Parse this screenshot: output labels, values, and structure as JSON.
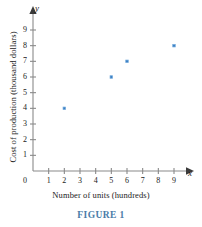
{
  "chart_data": {
    "type": "scatter",
    "title": "",
    "xlabel": "Number of units (hundreds)",
    "ylabel": "Cost of production (thousand dollars)",
    "xlim": [
      0,
      9.6
    ],
    "ylim": [
      0,
      9.6
    ],
    "xticks": [
      0,
      1,
      2,
      3,
      4,
      5,
      6,
      7,
      8,
      9
    ],
    "yticks": [
      1,
      2,
      3,
      4,
      5,
      6,
      7,
      8,
      9
    ],
    "grid": false,
    "legend": null,
    "x_axis_variable": "x",
    "y_axis_variable": "y",
    "points": [
      {
        "x": 2,
        "y": 4
      },
      {
        "x": 5,
        "y": 6
      },
      {
        "x": 6,
        "y": 7
      },
      {
        "x": 9,
        "y": 8
      }
    ],
    "marker": {
      "shape": "square",
      "color": "#3b7fc4",
      "edge_color": "#79aede"
    },
    "axis_color": "#8a8a8a",
    "origin_label": "0"
  },
  "caption": {
    "text": "FIGURE 1",
    "color": "#4a7ba7"
  }
}
